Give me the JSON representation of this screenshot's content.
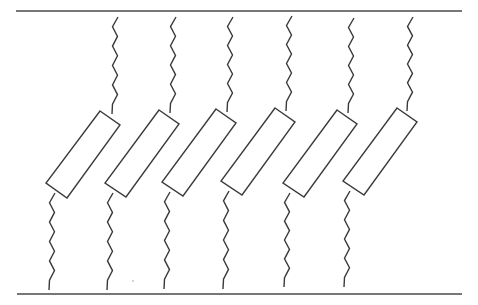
{
  "diagram": {
    "type": "mechanical-schematic",
    "colors": {
      "background": "#ffffff",
      "stroke": "#3a3a3a",
      "plate": "#4a4a4a"
    },
    "plates": {
      "top": {
        "x1": 16,
        "x2": 462,
        "y": 11
      },
      "bottom": {
        "x1": 17,
        "x2": 462,
        "y": 294
      }
    },
    "elements": [
      {
        "id": 1,
        "rect": [
          [
            100,
            111
          ],
          [
            120,
            125
          ],
          [
            67,
            198
          ],
          [
            46,
            183
          ]
        ],
        "top_spring": {
          "x": 118,
          "y_start": 17,
          "y_end": 114
        },
        "bottom_spring": {
          "x": 54,
          "y_start": 193,
          "y_end": 290
        }
      },
      {
        "id": 2,
        "rect": [
          [
            159,
            110
          ],
          [
            179,
            124
          ],
          [
            126,
            197
          ],
          [
            105,
            183
          ]
        ],
        "top_spring": {
          "x": 176,
          "y_start": 17,
          "y_end": 113
        },
        "bottom_spring": {
          "x": 112,
          "y_start": 193,
          "y_end": 290
        }
      },
      {
        "id": 3,
        "rect": [
          [
            216,
            109
          ],
          [
            236,
            123
          ],
          [
            183,
            196
          ],
          [
            162,
            182
          ]
        ],
        "top_spring": {
          "x": 233,
          "y_start": 17,
          "y_end": 112
        },
        "bottom_spring": {
          "x": 169,
          "y_start": 192,
          "y_end": 289
        }
      },
      {
        "id": 4,
        "rect": [
          [
            275,
            108
          ],
          [
            295,
            122
          ],
          [
            242,
            195
          ],
          [
            221,
            181
          ]
        ],
        "top_spring": {
          "x": 292,
          "y_start": 16,
          "y_end": 111
        },
        "bottom_spring": {
          "x": 228,
          "y_start": 191,
          "y_end": 289
        }
      },
      {
        "id": 5,
        "rect": [
          [
            337,
            110
          ],
          [
            357,
            124
          ],
          [
            304,
            197
          ],
          [
            283,
            183
          ]
        ],
        "top_spring": {
          "x": 354,
          "y_start": 18,
          "y_end": 113
        },
        "bottom_spring": {
          "x": 289,
          "y_start": 193,
          "y_end": 287
        }
      },
      {
        "id": 6,
        "rect": [
          [
            397,
            108
          ],
          [
            417,
            122
          ],
          [
            364,
            195
          ],
          [
            343,
            181
          ]
        ],
        "top_spring": {
          "x": 413,
          "y_start": 17,
          "y_end": 111
        },
        "bottom_spring": {
          "x": 349,
          "y_start": 191,
          "y_end": 287
        }
      }
    ],
    "stray_mark": {
      "x": 133,
      "y": 281
    }
  }
}
